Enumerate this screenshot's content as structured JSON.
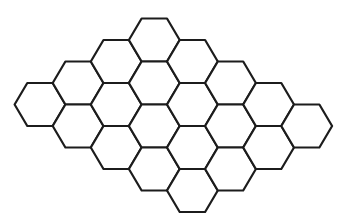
{
  "diagram": {
    "type": "hexagonal-grid",
    "orientation": "flat-top",
    "background": "#ffffff",
    "stroke_color": "#1c1c1c",
    "geometry": {
      "origin_x": 40,
      "origin_y": 18.5,
      "column_spacing": 38.1,
      "half_row_spacing": 21.5,
      "half_width": 25.4,
      "half_height": 21.5
    },
    "columns": [
      {
        "col": 0,
        "rows": [
          4
        ]
      },
      {
        "col": 1,
        "rows": [
          3,
          5
        ]
      },
      {
        "col": 2,
        "rows": [
          2,
          4,
          6
        ]
      },
      {
        "col": 3,
        "rows": [
          1,
          3,
          5,
          7
        ]
      },
      {
        "col": 4,
        "rows": [
          2,
          4,
          6,
          8
        ]
      },
      {
        "col": 5,
        "rows": [
          3,
          5,
          7
        ]
      },
      {
        "col": 6,
        "rows": [
          4,
          6
        ]
      },
      {
        "col": 7,
        "rows": [
          5
        ]
      }
    ],
    "hex_count": 20
  }
}
